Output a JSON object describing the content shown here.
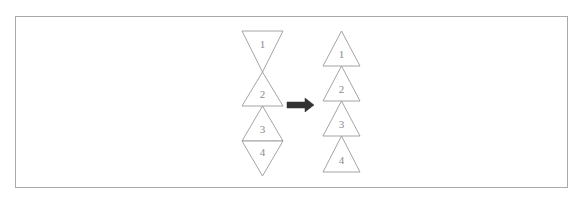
{
  "figure": {
    "canvas": {
      "width": 585,
      "height": 207,
      "background": "#ffffff"
    },
    "frame": {
      "name": "figure-border",
      "x": 15.5,
      "y": 16.5,
      "width": 552,
      "height": 171,
      "stroke": "#a9a9a9",
      "stroke_width": 1,
      "fill": "none"
    },
    "style": {
      "triangle_stroke": "#9a9a9a",
      "triangle_stroke_width": 0.9,
      "triangle_fill": "#ffffff",
      "label_color": "#8a8a8a",
      "arrow_color": "#333333"
    },
    "left_group": {
      "name": "left-triangle-stack",
      "caption": "before",
      "description": "alternating up/down triangles forming hourglass and diamond shapes",
      "center_x": 262.5,
      "half_width": 20.5,
      "triangles": [
        {
          "label": "1",
          "orientation": "down",
          "top": 31,
          "bottom": 72,
          "label_y": 45
        },
        {
          "label": "2",
          "orientation": "up",
          "top": 72,
          "bottom": 106,
          "label_y": 95
        },
        {
          "label": "3",
          "orientation": "up",
          "top": 106,
          "bottom": 141,
          "label_y": 130
        },
        {
          "label": "4",
          "orientation": "down",
          "top": 141,
          "bottom": 176,
          "label_y": 153
        }
      ]
    },
    "right_group": {
      "name": "right-triangle-stack",
      "caption": "after",
      "description": "all triangles pointing up, stacked contiguously",
      "center_x": 341.5,
      "half_width": 18.5,
      "triangles": [
        {
          "label": "1",
          "orientation": "up",
          "top": 31,
          "bottom": 66,
          "label_y": 55
        },
        {
          "label": "2",
          "orientation": "up",
          "top": 66,
          "bottom": 101,
          "label_y": 90
        },
        {
          "label": "3",
          "orientation": "up",
          "top": 101,
          "bottom": 136,
          "label_y": 125
        },
        {
          "label": "4",
          "orientation": "up",
          "top": 136,
          "bottom": 172,
          "label_y": 161
        }
      ]
    },
    "arrow": {
      "name": "transform-arrow",
      "direction": "right",
      "x_start": 287,
      "x_end": 314,
      "y": 105,
      "shaft_thickness": 6,
      "head_length": 9,
      "head_half_height": 7,
      "color": "#333333"
    }
  }
}
